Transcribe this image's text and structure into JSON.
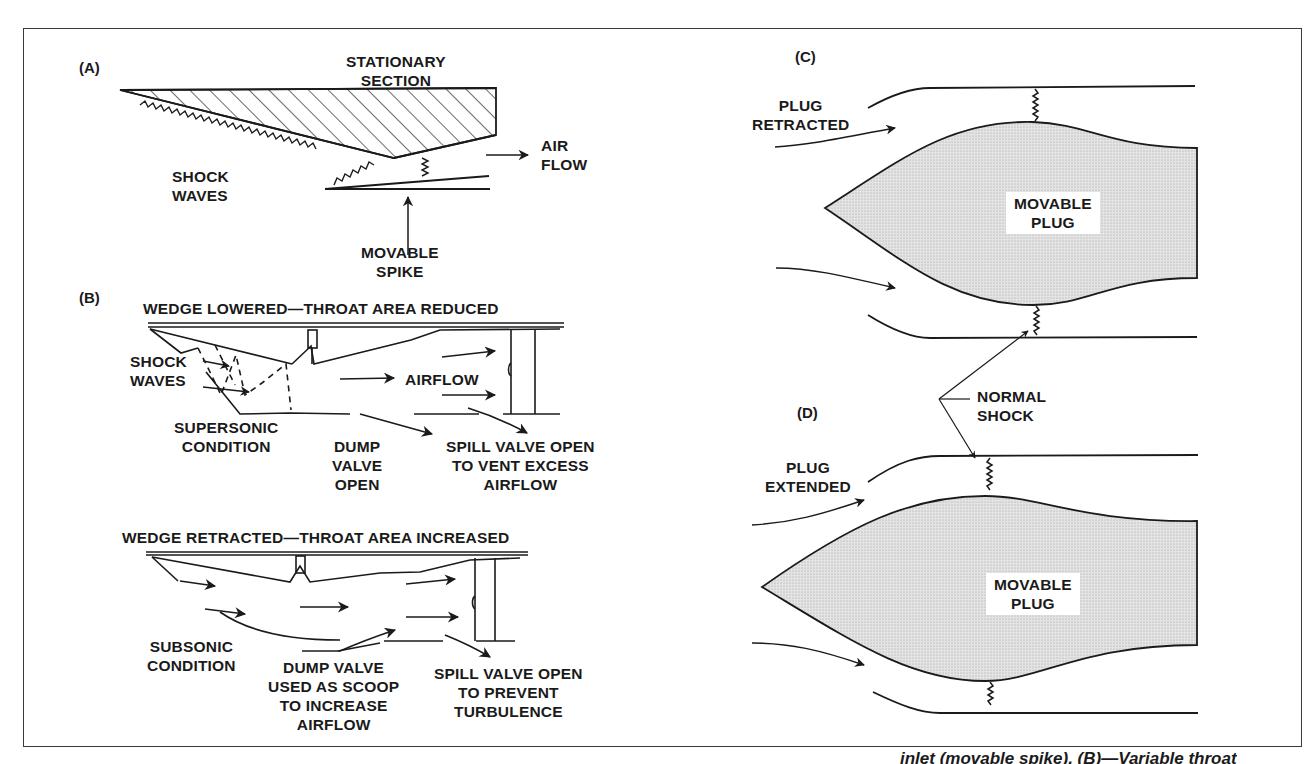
{
  "figure": {
    "panels": {
      "A": {
        "id": "(A)",
        "labels": {
          "stationary_section": [
            "STATIONARY",
            "SECTION"
          ],
          "shock_waves": [
            "SHOCK",
            "WAVES"
          ],
          "air_flow": [
            "AIR",
            "FLOW"
          ],
          "movable_spike": [
            "MOVABLE",
            "SPIKE"
          ]
        }
      },
      "B": {
        "id": "(B)",
        "upper": {
          "title": "WEDGE LOWERED—THROAT AREA REDUCED",
          "shock_waves": [
            "SHOCK",
            "WAVES"
          ],
          "airflow": "AIRFLOW",
          "condition": [
            "SUPERSONIC",
            "CONDITION"
          ],
          "dump_valve": [
            "DUMP",
            "VALVE",
            "OPEN"
          ],
          "spill_valve": [
            "SPILL VALVE OPEN",
            "TO VENT EXCESS",
            "AIRFLOW"
          ]
        },
        "lower": {
          "title": "WEDGE RETRACTED—THROAT AREA INCREASED",
          "condition": [
            "SUBSONIC",
            "CONDITION"
          ],
          "dump_valve": [
            "DUMP VALVE",
            "USED AS SCOOP",
            "TO INCREASE",
            "AIRFLOW"
          ],
          "spill_valve": [
            "SPILL VALVE OPEN",
            "TO PREVENT",
            "TURBULENCE"
          ]
        }
      },
      "C": {
        "id": "(C)",
        "state": [
          "PLUG",
          "RETRACTED"
        ],
        "plug": [
          "MOVABLE",
          "PLUG"
        ]
      },
      "D": {
        "id": "(D)",
        "state": [
          "PLUG",
          "EXTENDED"
        ],
        "plug": [
          "MOVABLE",
          "PLUG"
        ]
      },
      "shared": {
        "normal_shock": [
          "NORMAL",
          "SHOCK"
        ]
      }
    },
    "caption": "inlet (movable spike). (B)—Variable throat"
  },
  "colors": {
    "ink": "#1a1a1a",
    "plug_fill": "#dcdcdc",
    "frame": "#3a3a3a"
  }
}
